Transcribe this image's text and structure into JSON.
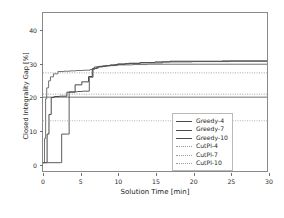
{
  "chart_data": {
    "type": "line",
    "title": "",
    "xlabel": "Solution Time [min]",
    "ylabel": "Closed Integrality Gap [%]",
    "xlim": [
      0,
      30
    ],
    "ylim": [
      -2.5,
      45
    ],
    "xticks": [
      0,
      5,
      10,
      15,
      20,
      25,
      30
    ],
    "yticks": [
      0,
      10,
      20,
      30,
      40
    ],
    "grid": false,
    "legend_position": "lower right",
    "series": [
      {
        "name": "Greedy-4",
        "style": "solid",
        "color": "#3f3f3f",
        "kind": "step",
        "x": [
          0,
          0.35,
          0.55,
          0.8,
          1.1,
          1.5,
          2.2,
          3.2,
          4.3,
          5.2,
          6.1,
          6.6,
          7.2,
          8.0,
          9.0,
          10.0,
          11.5,
          13.0,
          15.0,
          17.0,
          20.0,
          24.0,
          30.0
        ],
        "y": [
          0,
          0,
          8.6,
          14.5,
          19.6,
          19.9,
          20.0,
          21.2,
          23.4,
          24.3,
          25.9,
          28.3,
          28.8,
          29.1,
          29.4,
          29.7,
          29.9,
          30.1,
          30.3,
          30.5,
          30.5,
          30.6,
          30.6
        ]
      },
      {
        "name": "Greedy-7",
        "style": "solid",
        "color": "#6a6a6a",
        "kind": "step",
        "x": [
          0,
          0.2,
          0.35,
          0.5,
          0.75,
          1.0,
          1.4,
          2.0,
          2.8,
          3.6,
          4.4,
          5.4,
          6.3,
          6.9,
          7.6,
          8.6,
          10.0,
          12.0,
          14.0,
          17.0,
          21.0,
          26.0,
          30.0
        ],
        "y": [
          0,
          7.3,
          19.2,
          22.5,
          24.6,
          25.8,
          26.7,
          27.4,
          27.5,
          27.6,
          27.7,
          27.8,
          28.0,
          28.8,
          29.0,
          29.2,
          29.4,
          29.5,
          29.6,
          29.6,
          29.6,
          29.6,
          29.6
        ]
      },
      {
        "name": "Greedy-10",
        "style": "solid",
        "color": "#535353",
        "kind": "step",
        "x": [
          0,
          0.3,
          0.6,
          1.2,
          2.3,
          2.5,
          3.3,
          3.5,
          4.6,
          5.3,
          6.2,
          6.7,
          7.4,
          8.4,
          9.6,
          11.0,
          13.0,
          16.0,
          20.0,
          25.0,
          30.0
        ],
        "y": [
          0,
          0,
          0,
          0,
          0,
          8.6,
          8.6,
          21.3,
          21.4,
          21.5,
          25.7,
          28.4,
          28.9,
          29.2,
          29.5,
          29.8,
          30.0,
          30.3,
          30.4,
          30.5,
          30.5
        ]
      },
      {
        "name": "CutPl-4",
        "style": "dotted",
        "color": "#9a9a9a",
        "kind": "constant",
        "level": 27.0
      },
      {
        "name": "CutPl-7",
        "style": "dotted",
        "color": "#9a9a9a",
        "kind": "constant",
        "level": 20.6
      },
      {
        "name": "CutPl-10",
        "style": "dotted",
        "color": "#a8a8a8",
        "kind": "constant",
        "level": 12.6
      }
    ],
    "reference_lines": [
      {
        "name": "CutPl-7-solid-overlay",
        "level": 19.7,
        "style": "solid",
        "color": "#6b6b6b"
      }
    ]
  },
  "legend": {
    "items": [
      {
        "label": "Greedy-4",
        "style": "solid"
      },
      {
        "label": "Greedy-7",
        "style": "solid"
      },
      {
        "label": "Greedy-10",
        "style": "solid"
      },
      {
        "label": "CutPl-4",
        "style": "dotted"
      },
      {
        "label": "CutPl-7",
        "style": "dotted"
      },
      {
        "label": "CutPl-10",
        "style": "dotted"
      }
    ]
  }
}
